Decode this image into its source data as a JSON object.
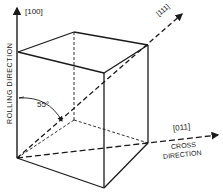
{
  "diagram": {
    "type": "crystal-orientation-cube",
    "labels": {
      "rolling_axis": "[100]",
      "diagonal_axis": "[111]",
      "cross_axis": "[011]",
      "rolling_direction": "ROLLING DIRECTION",
      "cross_direction_line1": "CROSS",
      "cross_direction_line2": "DIRECTION",
      "angle": "55°"
    },
    "colors": {
      "ink": "#1a1a1a",
      "background": "#ffffff"
    }
  }
}
